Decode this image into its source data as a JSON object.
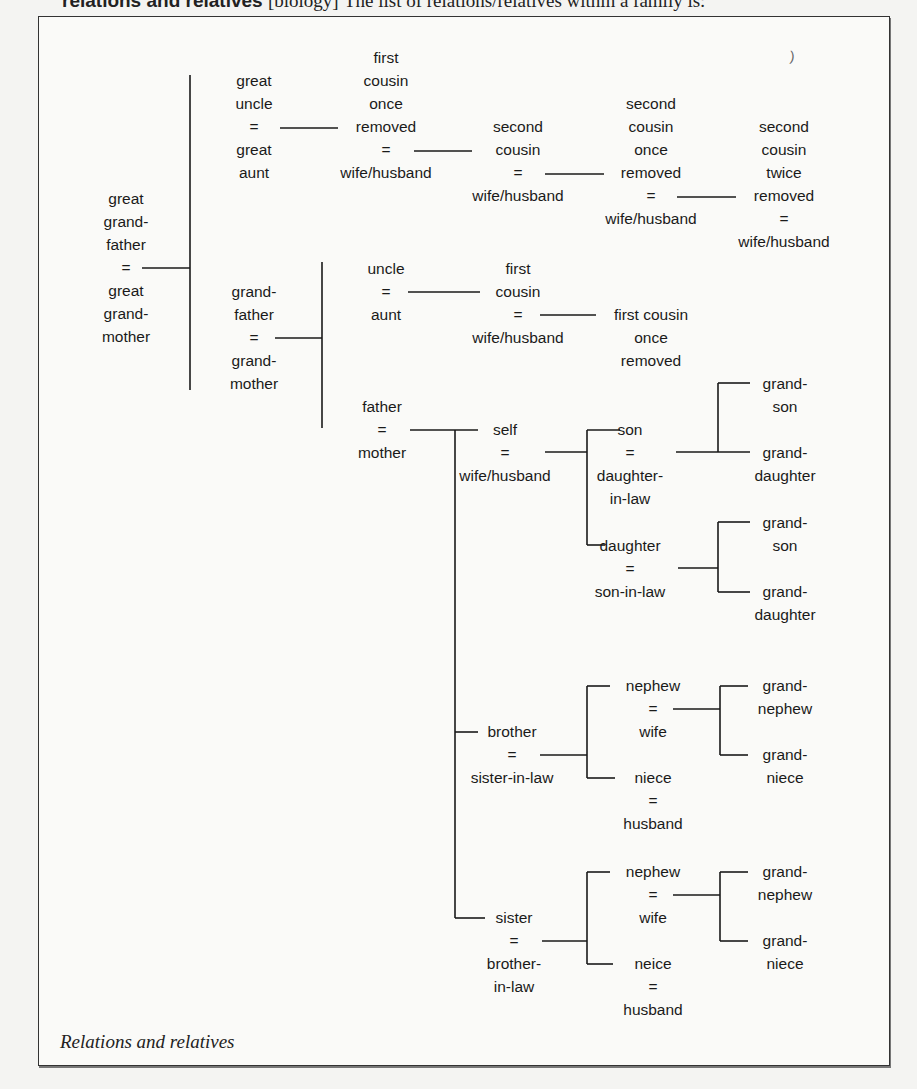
{
  "header": {
    "term": "relations and relatives",
    "bracket": "[biology]",
    "text": "The list of relations/relatives within a family is:"
  },
  "caption": "Relations and relatives",
  "stray_mark": ")",
  "nodes": {
    "great_grandparents": [
      "great",
      "grand-",
      "father",
      "=",
      "great",
      "grand-",
      "mother"
    ],
    "great_uncle": [
      "great",
      "uncle",
      "=",
      "great",
      "aunt"
    ],
    "first_cousin_once_removed_top": [
      "first",
      "cousin",
      "once",
      "removed",
      "=",
      "wife/husband"
    ],
    "second_cousin": [
      "second",
      "cousin",
      "=",
      "wife/husband"
    ],
    "second_cousin_once_removed": [
      "second",
      "cousin",
      "once",
      "removed",
      "=",
      "wife/husband"
    ],
    "second_cousin_twice_removed": [
      "second",
      "cousin",
      "twice",
      "removed",
      "=",
      "wife/husband"
    ],
    "grandparents": [
      "grand-",
      "father",
      "=",
      "grand-",
      "mother"
    ],
    "uncle": [
      "uncle",
      "=",
      "aunt"
    ],
    "first_cousin": [
      "first",
      "cousin",
      "=",
      "wife/husband"
    ],
    "first_cousin_once_removed": [
      "first cousin",
      "once",
      "removed"
    ],
    "parents": [
      "father",
      "=",
      "mother"
    ],
    "self": [
      "self",
      "=",
      "wife/husband"
    ],
    "son": [
      "son",
      "=",
      "daughter-",
      "in-law"
    ],
    "daughter": [
      "daughter",
      "=",
      "son-in-law"
    ],
    "grandson_1": [
      "grand-",
      "son"
    ],
    "granddaughter_1": [
      "grand-",
      "daughter"
    ],
    "grandson_2": [
      "grand-",
      "son"
    ],
    "granddaughter_2": [
      "grand-",
      "daughter"
    ],
    "brother": [
      "brother",
      "=",
      "sister-in-law"
    ],
    "nephew_1": [
      "nephew",
      "=",
      "wife"
    ],
    "niece_1": [
      "niece",
      "=",
      "husband"
    ],
    "grandnephew_1": [
      "grand-",
      "nephew"
    ],
    "grandniece_1": [
      "grand-",
      "niece"
    ],
    "sister": [
      "sister",
      "=",
      "brother-",
      "in-law"
    ],
    "nephew_2": [
      "nephew",
      "=",
      "wife"
    ],
    "niece_2": [
      "neice",
      "=",
      "husband"
    ],
    "grandnephew_2": [
      "grand-",
      "nephew"
    ],
    "grandniece_2": [
      "grand-",
      "niece"
    ]
  },
  "colors": {
    "line": "#1a1a1a",
    "text": "#1a1a1a",
    "frame": "#333333",
    "background": "#f4f4f2"
  }
}
